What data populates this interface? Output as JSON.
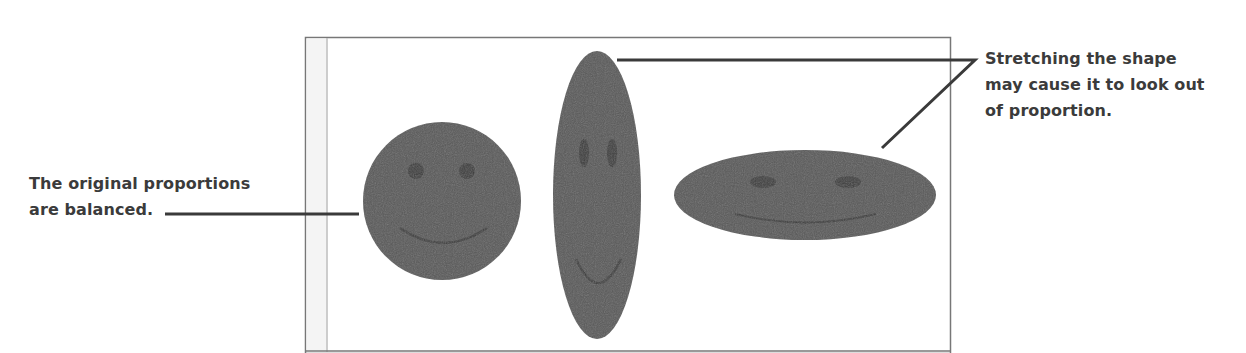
{
  "figure": {
    "callouts": {
      "left": {
        "lines": [
          "The original proportions",
          "are balanced."
        ]
      },
      "right": {
        "lines": [
          "Stretching the shape",
          "may cause it to look out",
          "of proportion."
        ]
      }
    },
    "shapes": [
      {
        "name": "original-circle-face",
        "type": "circle"
      },
      {
        "name": "vertically-stretched-face",
        "type": "tall-ellipse"
      },
      {
        "name": "horizontally-stretched-face",
        "type": "wide-ellipse"
      }
    ],
    "colors": {
      "face_fill": "#5a5a5a",
      "feature_fill": "#3e3e3e",
      "text": "#3b3b3b",
      "leader_line": "#3a3a3a",
      "frame_border": "#777777",
      "frame_inner_line": "#bdbdbd"
    }
  }
}
